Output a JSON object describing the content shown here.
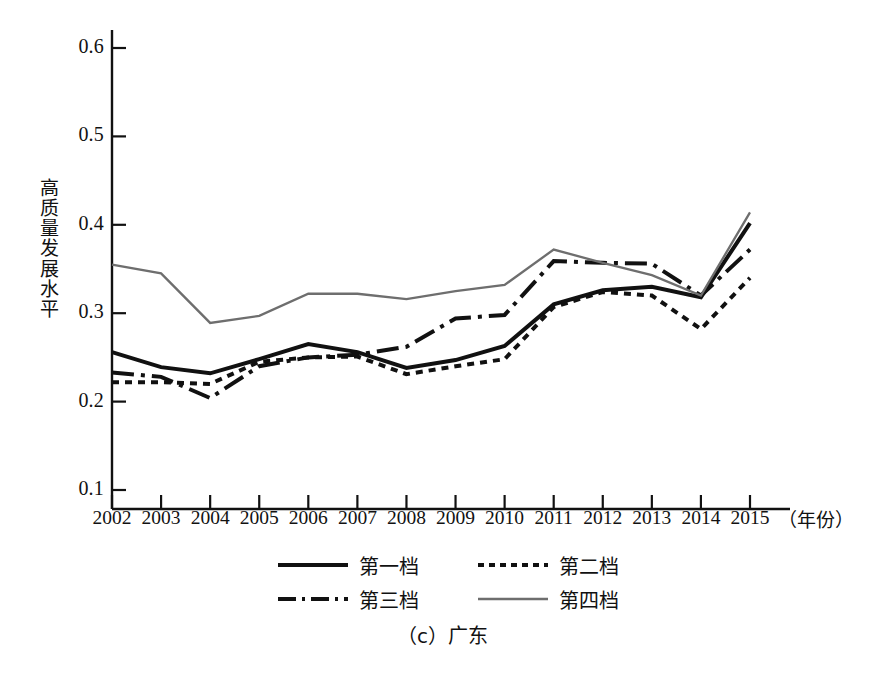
{
  "caption": "（c）广东",
  "axes": {
    "y_title": "高质量发展水平",
    "y_title_chars": [
      "高",
      "质",
      "量",
      "发",
      "展",
      "水",
      "平"
    ],
    "x_unit": "（年份）",
    "y_ticks": [
      "0.6",
      "0.5",
      "0.4",
      "0.3",
      "0.2",
      "0.1"
    ],
    "x_ticks": [
      "2002",
      "2003",
      "2004",
      "2005",
      "2006",
      "2007",
      "2008",
      "2009",
      "2010",
      "2011",
      "2012",
      "2013",
      "2014",
      "2015"
    ]
  },
  "legend": {
    "items": [
      {
        "label": "第一档",
        "style": "solid",
        "color": "#111111"
      },
      {
        "label": "第二档",
        "style": "dotted",
        "color": "#111111"
      },
      {
        "label": "第三档",
        "style": "dashdot",
        "color": "#111111"
      },
      {
        "label": "第四档",
        "style": "solid-thin",
        "color": "#6e6e6e"
      }
    ]
  },
  "chart_data": {
    "type": "line",
    "title": "（c）广东",
    "xlabel": "（年份）",
    "ylabel": "高质量发展水平",
    "categories": [
      "2002",
      "2003",
      "2004",
      "2005",
      "2006",
      "2007",
      "2008",
      "2009",
      "2010",
      "2011",
      "2012",
      "2013",
      "2014",
      "2015"
    ],
    "x": [
      2002,
      2003,
      2004,
      2005,
      2006,
      2007,
      2008,
      2009,
      2010,
      2011,
      2012,
      2013,
      2014,
      2015
    ],
    "ylim": [
      0.1,
      0.62
    ],
    "xlim": [
      2002,
      2015
    ],
    "grid": false,
    "legend_position": "bottom",
    "series": [
      {
        "name": "第一档",
        "style": "solid",
        "color": "#111111",
        "values": [
          0.256,
          0.239,
          0.232,
          0.248,
          0.265,
          0.256,
          0.238,
          0.247,
          0.263,
          0.31,
          0.326,
          0.33,
          0.318,
          0.402
        ]
      },
      {
        "name": "第二档",
        "style": "dotted",
        "color": "#111111",
        "values": [
          0.222,
          0.222,
          0.22,
          0.245,
          0.25,
          0.251,
          0.231,
          0.24,
          0.248,
          0.307,
          0.324,
          0.32,
          0.282,
          0.34
        ]
      },
      {
        "name": "第三档",
        "style": "dashdot",
        "color": "#111111",
        "values": [
          0.233,
          0.228,
          0.204,
          0.24,
          0.25,
          0.253,
          0.262,
          0.294,
          0.298,
          0.359,
          0.357,
          0.356,
          0.32,
          0.372
        ]
      },
      {
        "name": "第四档",
        "style": "solid-thin",
        "color": "#6e6e6e",
        "values": [
          0.355,
          0.345,
          0.289,
          0.297,
          0.322,
          0.322,
          0.316,
          0.325,
          0.332,
          0.372,
          0.357,
          0.343,
          0.32,
          0.414
        ]
      }
    ]
  }
}
